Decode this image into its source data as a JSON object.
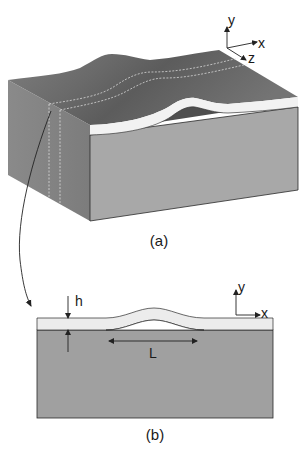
{
  "figure": {
    "panel_a": {
      "caption": "(a)",
      "axes": {
        "y": "y",
        "x": "x",
        "z": "z"
      }
    },
    "panel_b": {
      "caption": "(b)",
      "axes": {
        "y": "y",
        "x": "x"
      },
      "thickness_label": "h",
      "length_label": "L"
    }
  },
  "colors": {
    "top_surface": "#7a7a7a",
    "top_surface_dark": "#5f5f5f",
    "left_face": "#8c8c8c",
    "front_face": "#a9a9a9",
    "film_layer": "#f2f2f2",
    "substrate_b": "#9f9f9f",
    "film_b": "#ececec",
    "line": "#222222"
  }
}
